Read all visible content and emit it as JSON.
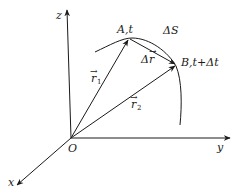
{
  "diagram": {
    "axes": {
      "x_label": "x",
      "y_label": "y",
      "z_label": "z",
      "origin_label": "O"
    },
    "points": {
      "A_label": "A,t",
      "B_label": "B,t+Δt"
    },
    "vectors": {
      "r1_label": "r⃗1",
      "r1_base": "r",
      "r1_sub": "1",
      "r2_base": "r",
      "r2_sub": "2",
      "delta_r_label": "Δr⃗",
      "delta_r_base": "Δr"
    },
    "path_label": "ΔS",
    "colors": {
      "line": "#1a1a1a",
      "background": "#ffffff"
    }
  }
}
